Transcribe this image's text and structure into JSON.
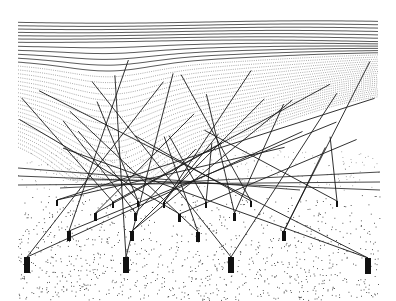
{
  "artwork": {
    "description": "Generative line drawing: flowing horizontal contour lines above, crossing straight lines converging to black rectangular posts over a stippled dot field",
    "colors": {
      "background": "#ffffff",
      "ink": "#1a1a1a",
      "dots": "#333333"
    },
    "frame": {
      "x": 18,
      "y": 20,
      "width": 362,
      "height": 282
    },
    "posts": {
      "large": [
        [
          24,
          257
        ],
        [
          123,
          257
        ],
        [
          228,
          257
        ],
        [
          365,
          258
        ]
      ],
      "mid": [
        [
          67,
          231
        ],
        [
          130,
          231
        ],
        [
          196,
          232
        ],
        [
          282,
          231
        ]
      ],
      "small": [
        [
          94,
          213
        ],
        [
          134,
          213
        ],
        [
          178,
          214
        ],
        [
          233,
          213
        ]
      ],
      "tiny": [
        [
          56,
          200
        ],
        [
          112,
          202
        ],
        [
          137,
          201
        ],
        [
          163,
          202
        ],
        [
          205,
          202
        ],
        [
          250,
          201
        ],
        [
          336,
          201
        ]
      ]
    }
  }
}
